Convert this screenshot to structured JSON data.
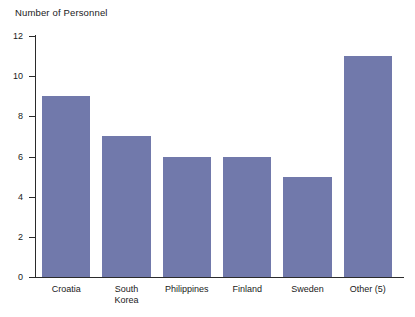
{
  "chart_data": {
    "type": "bar",
    "title": "Number of Personnel",
    "xlabel": "",
    "ylabel": "",
    "ylim": [
      0,
      12
    ],
    "yticks": [
      0,
      2,
      4,
      6,
      8,
      10,
      12
    ],
    "grid": false,
    "legend": false,
    "bar_color": "#7179ab",
    "axis_color": "#2b2b2b",
    "categories": [
      "Croatia",
      "South Korea",
      "Philippines",
      "Finland",
      "Sweden",
      "Other (5)"
    ],
    "category_lines": [
      [
        "Croatia"
      ],
      [
        "South",
        "Korea"
      ],
      [
        "Philippines"
      ],
      [
        "Finland"
      ],
      [
        "Sweden"
      ],
      [
        "Other (5)"
      ]
    ],
    "values": [
      9,
      7,
      6,
      6,
      5,
      11
    ]
  }
}
